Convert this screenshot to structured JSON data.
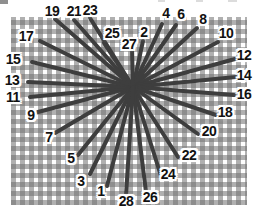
{
  "figure": {
    "kind": "needlepoint-ray-stitch-diagram",
    "stitch_color": "#3e3e3e",
    "stitch_width": 4,
    "label_color": "#111111",
    "mesh": {
      "x": 11,
      "y": 17,
      "width": 236,
      "height": 188,
      "thread_color": "#b1b1b1",
      "hole_color": "#ffffff"
    },
    "center": {
      "x": 133,
      "y": 87
    },
    "stitches": [
      {
        "n": "1",
        "tip": {
          "x": 107,
          "y": 186
        },
        "label": {
          "x": 101,
          "y": 191
        }
      },
      {
        "n": "2",
        "tip": {
          "x": 143,
          "y": 41
        },
        "label": {
          "x": 144,
          "y": 32
        }
      },
      {
        "n": "3",
        "tip": {
          "x": 90,
          "y": 174
        },
        "label": {
          "x": 81,
          "y": 181
        }
      },
      {
        "n": "4",
        "tip": {
          "x": 162,
          "y": 24
        },
        "label": {
          "x": 166,
          "y": 13
        }
      },
      {
        "n": "5",
        "tip": {
          "x": 78,
          "y": 155
        },
        "label": {
          "x": 71,
          "y": 158
        }
      },
      {
        "n": "6",
        "tip": {
          "x": 176,
          "y": 25
        },
        "label": {
          "x": 181,
          "y": 14
        }
      },
      {
        "n": "7",
        "tip": {
          "x": 55,
          "y": 133
        },
        "label": {
          "x": 49,
          "y": 137
        }
      },
      {
        "n": "8",
        "tip": {
          "x": 197,
          "y": 28
        },
        "label": {
          "x": 203,
          "y": 19
        }
      },
      {
        "n": "9",
        "tip": {
          "x": 38,
          "y": 112
        },
        "label": {
          "x": 31,
          "y": 115
        }
      },
      {
        "n": "10",
        "tip": {
          "x": 218,
          "y": 42
        },
        "label": {
          "x": 226,
          "y": 33
        }
      },
      {
        "n": "11",
        "tip": {
          "x": 30,
          "y": 97
        },
        "label": {
          "x": 13,
          "y": 97
        }
      },
      {
        "n": "12",
        "tip": {
          "x": 235,
          "y": 59
        },
        "label": {
          "x": 244,
          "y": 55
        }
      },
      {
        "n": "13",
        "tip": {
          "x": 28,
          "y": 82
        },
        "label": {
          "x": 12,
          "y": 80
        }
      },
      {
        "n": "14",
        "tip": {
          "x": 236,
          "y": 77
        },
        "label": {
          "x": 244,
          "y": 75
        }
      },
      {
        "n": "15",
        "tip": {
          "x": 32,
          "y": 62
        },
        "label": {
          "x": 13,
          "y": 59
        }
      },
      {
        "n": "16",
        "tip": {
          "x": 234,
          "y": 95
        },
        "label": {
          "x": 244,
          "y": 94
        }
      },
      {
        "n": "17",
        "tip": {
          "x": 40,
          "y": 41
        },
        "label": {
          "x": 26,
          "y": 36
        }
      },
      {
        "n": "18",
        "tip": {
          "x": 216,
          "y": 115
        },
        "label": {
          "x": 225,
          "y": 112
        }
      },
      {
        "n": "19",
        "tip": {
          "x": 55,
          "y": 19
        },
        "label": {
          "x": 52,
          "y": 11
        }
      },
      {
        "n": "20",
        "tip": {
          "x": 198,
          "y": 134
        },
        "label": {
          "x": 209,
          "y": 131
        }
      },
      {
        "n": "21",
        "tip": {
          "x": 74,
          "y": 20
        },
        "label": {
          "x": 74,
          "y": 11
        }
      },
      {
        "n": "22",
        "tip": {
          "x": 178,
          "y": 157
        },
        "label": {
          "x": 189,
          "y": 155
        }
      },
      {
        "n": "23",
        "tip": {
          "x": 90,
          "y": 18
        },
        "label": {
          "x": 90,
          "y": 10
        }
      },
      {
        "n": "24",
        "tip": {
          "x": 161,
          "y": 176
        },
        "label": {
          "x": 168,
          "y": 174
        }
      },
      {
        "n": "25",
        "tip": {
          "x": 104,
          "y": 43
        },
        "label": {
          "x": 112,
          "y": 33
        }
      },
      {
        "n": "26",
        "tip": {
          "x": 146,
          "y": 192
        },
        "label": {
          "x": 150,
          "y": 197
        }
      },
      {
        "n": "27",
        "tip": {
          "x": 132,
          "y": 48
        },
        "label": {
          "x": 129,
          "y": 44
        }
      },
      {
        "n": "28",
        "tip": {
          "x": 126,
          "y": 195
        },
        "label": {
          "x": 126,
          "y": 201
        }
      }
    ]
  }
}
